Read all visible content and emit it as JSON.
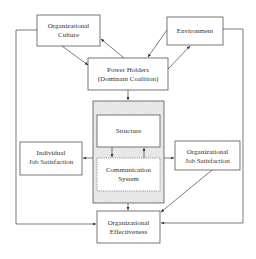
{
  "diagram": {
    "nodes": {
      "culture": {
        "lines": [
          "Organizational",
          "Culture"
        ]
      },
      "environment": {
        "lines": [
          "Environment"
        ]
      },
      "power": {
        "lines": [
          "Power Holders",
          "(Dominant Coalition)"
        ]
      },
      "structure": {
        "lines": [
          "Structure"
        ]
      },
      "communication": {
        "lines": [
          "Communication",
          "System"
        ]
      },
      "individual": {
        "lines": [
          "Individual",
          "Job Satisfaction"
        ]
      },
      "orgjob": {
        "lines": [
          "Organizational",
          "Job Satisfaction"
        ]
      },
      "effectiveness": {
        "lines": [
          "Organizational",
          "Effectiveness"
        ]
      }
    },
    "edges": [
      {
        "from": "culture",
        "to": "power"
      },
      {
        "from": "power",
        "to": "culture"
      },
      {
        "from": "environment",
        "to": "power"
      },
      {
        "from": "power",
        "to": "environment"
      },
      {
        "from": "power",
        "to": "organization-core"
      },
      {
        "from": "structure",
        "to": "communication"
      },
      {
        "from": "communication",
        "to": "structure"
      },
      {
        "from": "organization-core",
        "to": "individual"
      },
      {
        "from": "organization-core",
        "to": "orgjob"
      },
      {
        "from": "organization-core",
        "to": "effectiveness"
      },
      {
        "from": "orgjob",
        "to": "effectiveness"
      },
      {
        "from": "culture",
        "to": "effectiveness"
      },
      {
        "from": "environment",
        "to": "effectiveness"
      }
    ]
  }
}
